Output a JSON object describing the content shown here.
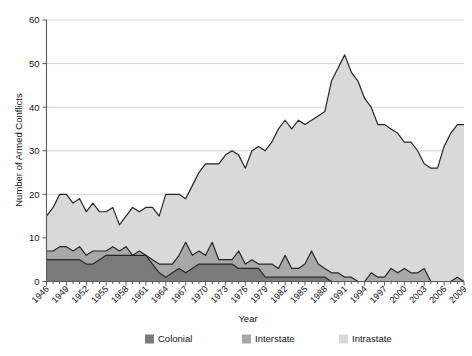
{
  "chart_data": {
    "type": "area",
    "stacked": true,
    "title": "",
    "xlabel": "Year",
    "ylabel": "Number of Armed Conflicts",
    "xlim": [
      1946,
      2009
    ],
    "ylim": [
      0,
      60
    ],
    "ytick_step": 10,
    "xtick_step": 3,
    "grid": true,
    "legend_position": "bottom",
    "ytick_labels": [
      "0",
      "10",
      "20",
      "30",
      "40",
      "50",
      "60"
    ],
    "xtick_labels": [
      "1946",
      "1949",
      "1952",
      "1955",
      "1958",
      "1961",
      "1964",
      "1967",
      "1970",
      "1973",
      "1976",
      "1979",
      "1982",
      "1985",
      "1988",
      "1991",
      "1994",
      "1997",
      "2000",
      "2003",
      "2006",
      "2009"
    ],
    "x": [
      1946,
      1947,
      1948,
      1949,
      1950,
      1951,
      1952,
      1953,
      1954,
      1955,
      1956,
      1957,
      1958,
      1959,
      1960,
      1961,
      1962,
      1963,
      1964,
      1965,
      1966,
      1967,
      1968,
      1969,
      1970,
      1971,
      1972,
      1973,
      1974,
      1975,
      1976,
      1977,
      1978,
      1979,
      1980,
      1981,
      1982,
      1983,
      1984,
      1985,
      1986,
      1987,
      1988,
      1989,
      1990,
      1991,
      1992,
      1993,
      1994,
      1995,
      1996,
      1997,
      1998,
      1999,
      2000,
      2001,
      2002,
      2003,
      2004,
      2005,
      2006,
      2007,
      2008,
      2009
    ],
    "series": [
      {
        "name": "Colonial",
        "color": "#7b7b7b",
        "values": [
          5,
          5,
          5,
          5,
          5,
          5,
          4,
          4,
          5,
          6,
          6,
          6,
          6,
          6,
          6,
          6,
          4,
          2,
          1,
          2,
          3,
          2,
          3,
          4,
          4,
          4,
          4,
          4,
          4,
          3,
          3,
          3,
          3,
          1,
          1,
          1,
          1,
          1,
          1,
          1,
          1,
          1,
          1,
          0,
          0,
          0,
          0,
          0,
          0,
          0,
          0,
          0,
          0,
          0,
          0,
          0,
          0,
          0,
          0,
          0,
          0,
          0,
          0,
          0
        ]
      },
      {
        "name": "Interstate",
        "color": "#a8a8a8",
        "values": [
          2,
          2,
          3,
          3,
          2,
          3,
          2,
          3,
          2,
          1,
          2,
          1,
          2,
          0,
          1,
          0,
          1,
          2,
          3,
          2,
          3,
          7,
          3,
          3,
          2,
          5,
          1,
          1,
          1,
          4,
          1,
          2,
          1,
          3,
          3,
          2,
          5,
          2,
          2,
          3,
          6,
          3,
          2,
          2,
          2,
          1,
          1,
          0,
          0,
          2,
          1,
          1,
          3,
          2,
          3,
          2,
          2,
          3,
          0,
          0,
          0,
          0,
          1,
          0
        ]
      },
      {
        "name": "Intrastate",
        "color": "#d9d9d9",
        "values": [
          8,
          10,
          12,
          12,
          11,
          11,
          10,
          11,
          9,
          9,
          9,
          6,
          7,
          11,
          9,
          11,
          12,
          11,
          16,
          16,
          14,
          10,
          16,
          18,
          21,
          18,
          22,
          24,
          25,
          22,
          22,
          25,
          27,
          26,
          28,
          32,
          31,
          32,
          34,
          32,
          30,
          34,
          36,
          44,
          47,
          51,
          47,
          46,
          42,
          38,
          35,
          35,
          32,
          32,
          29,
          30,
          28,
          24,
          26,
          26,
          31,
          34,
          35,
          36
        ]
      }
    ]
  },
  "axes": {
    "y_title": "Number of Armed Conflicts",
    "x_title": "Year"
  },
  "legend": {
    "items": [
      {
        "label": "Colonial",
        "color": "#7b7b7b"
      },
      {
        "label": "Interstate",
        "color": "#a8a8a8"
      },
      {
        "label": "Intrastate",
        "color": "#d9d9d9"
      }
    ]
  }
}
